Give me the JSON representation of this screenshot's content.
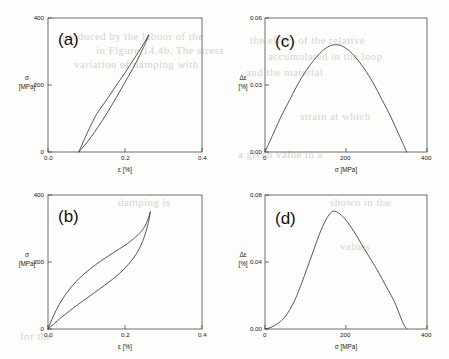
{
  "figure": {
    "background_bleed": [
      {
        "text": "produced by the labour of the",
        "x": 62,
        "y": 30
      },
      {
        "text": "in Figure 14.4b. The stress",
        "x": 96,
        "y": 44
      },
      {
        "text": "variation of damping with",
        "x": 74,
        "y": 58
      },
      {
        "text": "the effect of the relative",
        "x": 250,
        "y": 34
      },
      {
        "text": "accumulated in the loop",
        "x": 268,
        "y": 50
      },
      {
        "text": "and the material",
        "x": 246,
        "y": 66
      },
      {
        "text": "strain at which",
        "x": 300,
        "y": 110
      },
      {
        "text": "a given value in a",
        "x": 238,
        "y": 148
      },
      {
        "text": "shown in the",
        "x": 330,
        "y": 196
      },
      {
        "text": "damping is",
        "x": 118,
        "y": 196
      },
      {
        "text": "for the",
        "x": 20,
        "y": 330
      },
      {
        "text": "values",
        "x": 340,
        "y": 240
      }
    ],
    "axis_color": "#4a4a4a",
    "curve_color": "#3a3a3a"
  },
  "panels": [
    {
      "id": "a",
      "letter": "(a)",
      "xlabel": "ε [%]",
      "ylabel_line1": "σ",
      "ylabel_line2": "[MPa]",
      "xticks": [
        "0.0",
        "0.2",
        "0.4"
      ],
      "xtick_values": [
        0.0,
        0.2,
        0.4
      ],
      "yticks": [
        "0",
        "200",
        "400"
      ],
      "ytick_values": [
        0,
        200,
        400
      ],
      "xlim": [
        0.0,
        0.4
      ],
      "ylim": [
        0,
        400
      ]
    },
    {
      "id": "c",
      "letter": "(c)",
      "xlabel": "σ [MPa]",
      "ylabel_line1": "Δε",
      "ylabel_line2": "[%]",
      "xticks": [
        "0",
        "200",
        "400"
      ],
      "xtick_values": [
        0,
        200,
        400
      ],
      "yticks": [
        "0.00",
        "0.03",
        "0.06"
      ],
      "ytick_values": [
        0.0,
        0.03,
        0.06
      ],
      "xlim": [
        0,
        400
      ],
      "ylim": [
        0,
        0.06
      ]
    },
    {
      "id": "b",
      "letter": "(b)",
      "xlabel": "ε [%]",
      "ylabel_line1": "σ",
      "ylabel_line2": "[MPa]",
      "xticks": [
        "0.0",
        "0.2",
        "0.4"
      ],
      "xtick_values": [
        0.0,
        0.2,
        0.4
      ],
      "yticks": [
        "0",
        "200",
        "400"
      ],
      "ytick_values": [
        0,
        200,
        400
      ],
      "xlim": [
        0.0,
        0.4
      ],
      "ylim": [
        0,
        400
      ]
    },
    {
      "id": "d",
      "letter": "(d)",
      "xlabel": "σ [MPa]",
      "ylabel_line1": "Δε",
      "ylabel_line2": "[%]",
      "xticks": [
        "0",
        "200",
        "400"
      ],
      "xtick_values": [
        0,
        200,
        400
      ],
      "yticks": [
        "0.00",
        "0.04",
        "0.08"
      ],
      "ytick_values": [
        0.0,
        0.04,
        0.08
      ],
      "xlim": [
        0,
        400
      ],
      "ylim": [
        0,
        0.08
      ]
    }
  ],
  "chart_data": [
    {
      "type": "line",
      "panel": "a",
      "title": "(a)",
      "xlabel": "ε [%]",
      "ylabel": "σ [MPa]",
      "xlim": [
        0.0,
        0.4
      ],
      "ylim": [
        0,
        400
      ],
      "grid": false,
      "legend": "none",
      "description": "Narrow lens-shaped stress-strain hysteresis loop, residual strain 0.08%",
      "series": [
        {
          "name": "loading branch",
          "x": [
            0.08,
            0.095,
            0.112,
            0.13,
            0.15,
            0.17,
            0.19,
            0.21,
            0.23,
            0.248,
            0.262
          ],
          "y": [
            0,
            20,
            45,
            75,
            110,
            148,
            188,
            228,
            270,
            312,
            350
          ]
        },
        {
          "name": "unloading branch",
          "x": [
            0.262,
            0.25,
            0.236,
            0.22,
            0.202,
            0.183,
            0.164,
            0.145,
            0.126,
            0.104,
            0.08
          ],
          "y": [
            350,
            326,
            300,
            272,
            240,
            208,
            176,
            144,
            112,
            62,
            0
          ]
        }
      ]
    },
    {
      "type": "line",
      "panel": "c",
      "title": "(c)",
      "xlabel": "σ [MPa]",
      "ylabel": "Δε [%]",
      "xlim": [
        0,
        400
      ],
      "ylim": [
        0,
        0.06
      ],
      "grid": false,
      "legend": "none",
      "description": "Symmetric parabola-like damping curve, peak 0.048 near 175 MPa, returns to zero at 350 MPa",
      "x": [
        0,
        20,
        40,
        60,
        80,
        100,
        120,
        140,
        160,
        175,
        190,
        210,
        230,
        250,
        270,
        290,
        310,
        330,
        350
      ],
      "y": [
        0.0,
        0.008,
        0.016,
        0.023,
        0.03,
        0.036,
        0.041,
        0.045,
        0.0475,
        0.048,
        0.0475,
        0.045,
        0.041,
        0.036,
        0.03,
        0.023,
        0.016,
        0.008,
        0.0
      ]
    },
    {
      "type": "line",
      "panel": "b",
      "title": "(b)",
      "xlabel": "ε [%]",
      "ylabel": "σ [MPa]",
      "xlim": [
        0.0,
        0.4
      ],
      "ylim": [
        0,
        400
      ],
      "grid": false,
      "legend": "none",
      "description": "Flag-shaped superelastic hysteresis loop from origin to 0.265% / 350 MPa",
      "series": [
        {
          "name": "upper (unloading) branch",
          "x": [
            0.0,
            0.01,
            0.022,
            0.038,
            0.058,
            0.082,
            0.11,
            0.14,
            0.17,
            0.2,
            0.228,
            0.248,
            0.26,
            0.266
          ],
          "y": [
            0,
            28,
            58,
            90,
            122,
            152,
            180,
            205,
            228,
            250,
            275,
            300,
            328,
            350
          ]
        },
        {
          "name": "lower (loading) branch",
          "x": [
            0.0,
            0.016,
            0.034,
            0.056,
            0.08,
            0.106,
            0.132,
            0.158,
            0.184,
            0.208,
            0.23,
            0.246,
            0.258,
            0.266
          ],
          "y": [
            0,
            16,
            34,
            54,
            75,
            96,
            118,
            140,
            164,
            192,
            225,
            262,
            305,
            350
          ]
        }
      ]
    },
    {
      "type": "line",
      "panel": "d",
      "title": "(d)",
      "xlabel": "σ [MPa]",
      "ylabel": "Δε [%]",
      "xlim": [
        0,
        400
      ],
      "ylim": [
        0,
        0.08
      ],
      "grid": false,
      "legend": "none",
      "description": "Skewed damping curve with slow start, peak 0.070 near 165 MPa and near-linear decay to zero at 350 MPa",
      "x": [
        0,
        15,
        30,
        45,
        60,
        75,
        90,
        105,
        120,
        135,
        150,
        165,
        180,
        200,
        220,
        240,
        260,
        280,
        300,
        320,
        340,
        350
      ],
      "y": [
        0.0,
        0.001,
        0.003,
        0.006,
        0.011,
        0.018,
        0.027,
        0.037,
        0.047,
        0.057,
        0.065,
        0.07,
        0.0695,
        0.065,
        0.058,
        0.05,
        0.042,
        0.034,
        0.025,
        0.016,
        0.004,
        0.0
      ]
    }
  ]
}
